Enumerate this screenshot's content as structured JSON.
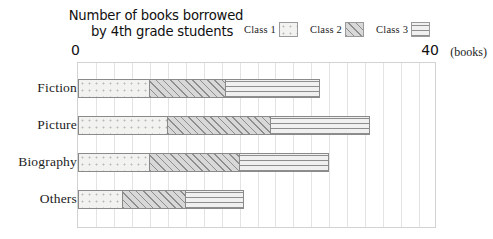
{
  "title": {
    "line1": "Number of books borrowed",
    "line2": "by 4th grade students"
  },
  "axis": {
    "min_label": "0",
    "max_label": "40",
    "unit_label": "(books)"
  },
  "legend": {
    "items": [
      {
        "label": "Class 1",
        "pattern": "dots",
        "swatch_name": "legend-swatch-class-1"
      },
      {
        "label": "Class 2",
        "pattern": "diagonal-hatch",
        "swatch_name": "legend-swatch-class-2"
      },
      {
        "label": "Class 3",
        "pattern": "horizontal-lines",
        "swatch_name": "legend-swatch-class-3"
      }
    ]
  },
  "rows": [
    {
      "label": "Fiction"
    },
    {
      "label": "Picture"
    },
    {
      "label": "Biography"
    },
    {
      "label": "Others"
    }
  ],
  "chart_data": {
    "type": "bar",
    "orientation": "horizontal",
    "stacked": true,
    "title": "Number of books borrowed by 4th grade students",
    "xlabel": "(books)",
    "ylabel": "",
    "xlim": [
      0,
      40
    ],
    "xtick_labels": [
      "0",
      "40"
    ],
    "grid": true,
    "grid_interval": 2,
    "legend_position": "top-right",
    "categories": [
      "Fiction",
      "Picture",
      "Biography",
      "Others"
    ],
    "series": [
      {
        "name": "Class 1",
        "values": [
          8,
          10,
          8,
          5
        ]
      },
      {
        "name": "Class 2",
        "values": [
          8.5,
          11.5,
          10,
          7
        ]
      },
      {
        "name": "Class 3",
        "values": [
          10.5,
          11,
          10,
          6.5
        ]
      }
    ],
    "totals": [
      27,
      32.5,
      28,
      18.5
    ]
  }
}
